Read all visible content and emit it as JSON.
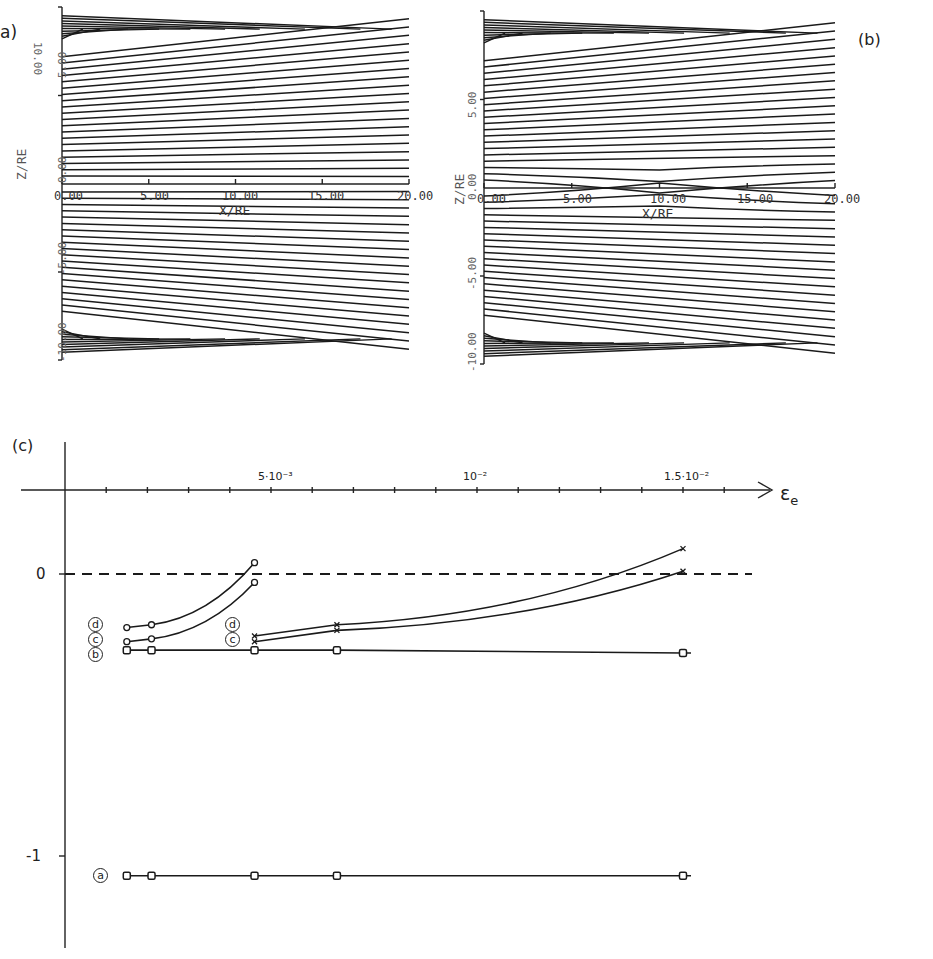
{
  "panels": {
    "a": {
      "label": "a)",
      "xlabel": "X/RE",
      "ylabel": "Z/RE",
      "xticks": [
        "0.00",
        "5.00",
        "10.00",
        "15.00",
        "20.00"
      ],
      "yticks": [
        "10.00",
        "5.00",
        "0.00",
        "-5.00",
        "-10.00"
      ],
      "description": "Magnetic field lines of a tail-like configuration, no perturbation"
    },
    "b": {
      "label": "(b)",
      "xlabel": "X/RE",
      "ylabel": "Z/RE",
      "xticks": [
        "0.00",
        "5.00",
        "10.00",
        "15.00",
        "20.00"
      ],
      "yticks": [
        "10.00",
        "5.00",
        "0.00",
        "-5.00",
        "-10.00"
      ],
      "description": "Magnetic field lines with a localized perturbation near X/RE = 10"
    },
    "c": {
      "label": "(c)",
      "xlabel": "ε",
      "xlabel_sub": "e",
      "xtick_labels": [
        "5·10⁻³",
        "10⁻²",
        "1.5·10⁻²"
      ],
      "ytick_labels": [
        "0",
        "-1"
      ],
      "curve_labels": [
        "d",
        "c",
        "b",
        "a",
        "d",
        "c"
      ]
    }
  },
  "chart_data": [
    {
      "type": "line",
      "title": "(a) field lines",
      "xlabel": "X/RE",
      "ylabel": "Z/RE",
      "xlim": [
        0,
        20
      ],
      "ylim": [
        -10,
        10
      ],
      "note": "~25 field lines above and below the equatorial plane, flaring outward toward X=0 (tail-like, straight lines)"
    },
    {
      "type": "line",
      "title": "(b) field lines with perturbation",
      "xlabel": "X/RE",
      "ylabel": "Z/RE",
      "xlim": [
        0,
        20
      ],
      "ylim": [
        -10,
        10
      ],
      "note": "Same configuration as (a) with lines near Z=0 pinched toward the equator at X≈10 RE"
    },
    {
      "type": "line",
      "title": "(c)",
      "xlabel": "εe",
      "ylabel": "",
      "xlim": [
        0,
        0.017
      ],
      "ylim": [
        -1.3,
        0.35
      ],
      "xticks": [
        0.005,
        0.01,
        0.015
      ],
      "yticks": [
        0,
        -1
      ],
      "reference_line": {
        "y": 0,
        "style": "dashed"
      },
      "series": [
        {
          "name": "d (low ε)",
          "marker": "circle",
          "x": [
            0.0015,
            0.0021,
            0.0046
          ],
          "y": [
            -0.19,
            -0.18,
            0.04
          ]
        },
        {
          "name": "c (low ε)",
          "marker": "circle",
          "x": [
            0.0015,
            0.0021,
            0.0046
          ],
          "y": [
            -0.24,
            -0.23,
            -0.03
          ]
        },
        {
          "name": "d (high ε)",
          "marker": "x",
          "x": [
            0.0046,
            0.0066,
            0.015
          ],
          "y": [
            -0.22,
            -0.18,
            0.09
          ]
        },
        {
          "name": "c (high ε)",
          "marker": "x",
          "x": [
            0.0046,
            0.0066,
            0.015
          ],
          "y": [
            -0.24,
            -0.2,
            0.01
          ]
        },
        {
          "name": "b",
          "marker": "square",
          "x": [
            0.0015,
            0.0021,
            0.0046,
            0.0066,
            0.015
          ],
          "y": [
            -0.27,
            -0.27,
            -0.27,
            -0.27,
            -0.28
          ]
        },
        {
          "name": "a",
          "marker": "square",
          "x": [
            0.0015,
            0.0021,
            0.0046,
            0.0066,
            0.015
          ],
          "y": [
            -1.07,
            -1.07,
            -1.07,
            -1.07,
            -1.07
          ]
        }
      ]
    }
  ]
}
